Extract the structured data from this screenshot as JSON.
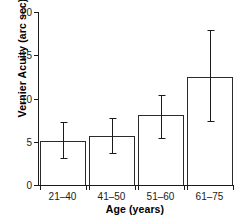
{
  "chart_data": {
    "type": "bar",
    "title": "",
    "xlabel": "Age (years)",
    "ylabel": "Vernier Acuity (arc sec)",
    "categories": [
      "21–40",
      "41–50",
      "51–60",
      "61–75"
    ],
    "values": [
      5.1,
      5.7,
      8.1,
      12.5
    ],
    "errors_low": [
      3.1,
      3.7,
      5.4,
      7.4
    ],
    "errors_high": [
      7.3,
      7.7,
      10.4,
      17.9
    ],
    "ylim": [
      0,
      20
    ],
    "yticks": [
      0,
      5,
      10,
      15,
      20
    ],
    "ytick_labels": [
      "0",
      "5",
      "10",
      "15",
      "20"
    ],
    "grid": false,
    "legend": "none",
    "bar_facecolor": "#ffffff",
    "bar_edgecolor": "#2b2b2b",
    "error_color": "#1a1a1a",
    "axis_color": "#1a1a1a"
  }
}
